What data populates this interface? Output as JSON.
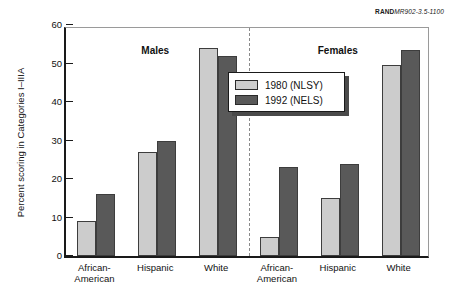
{
  "credit": {
    "brand": "RAND",
    "document_number": "MR902-3.5-1100"
  },
  "chart_data": {
    "type": "bar",
    "title": "",
    "xlabel": "",
    "ylabel": "Percent scoring in Categories I–IIIA",
    "ylim": [
      0,
      60
    ],
    "yticks": [
      0,
      10,
      20,
      30,
      40,
      50,
      60
    ],
    "ytick_labels": [
      "0",
      "10",
      "20",
      "30",
      "40",
      "50",
      "60"
    ],
    "grid": false,
    "legend_position": "center",
    "panels": [
      {
        "name": "Males",
        "label": "Males",
        "categories": [
          "African-American",
          "Hispanic",
          "White"
        ],
        "series": [
          {
            "name": "1980 (NLSY)",
            "values": [
              9,
              27,
              54
            ]
          },
          {
            "name": "1992 (NELS)",
            "values": [
              16,
              30,
              52
            ]
          }
        ]
      },
      {
        "name": "Females",
        "label": "Females",
        "categories": [
          "African-American",
          "Hispanic",
          "White"
        ],
        "series": [
          {
            "name": "1980 (NLSY)",
            "values": [
              5,
              15,
              49.5
            ]
          },
          {
            "name": "1992 (NELS)",
            "values": [
              23,
              24,
              53.5
            ]
          }
        ]
      }
    ],
    "series_colors": {
      "1980 (NLSY)": "#cccccc",
      "1992 (NELS)": "#595959"
    },
    "legend": [
      {
        "label": "1980 (NLSY)",
        "color": "#cccccc"
      },
      {
        "label": "1992 (NELS)",
        "color": "#595959"
      }
    ],
    "category_label_lines": {
      "African-American": [
        "African-",
        "American"
      ],
      "Hispanic": [
        "Hispanic"
      ],
      "White": [
        "White"
      ]
    },
    "divider": true
  }
}
